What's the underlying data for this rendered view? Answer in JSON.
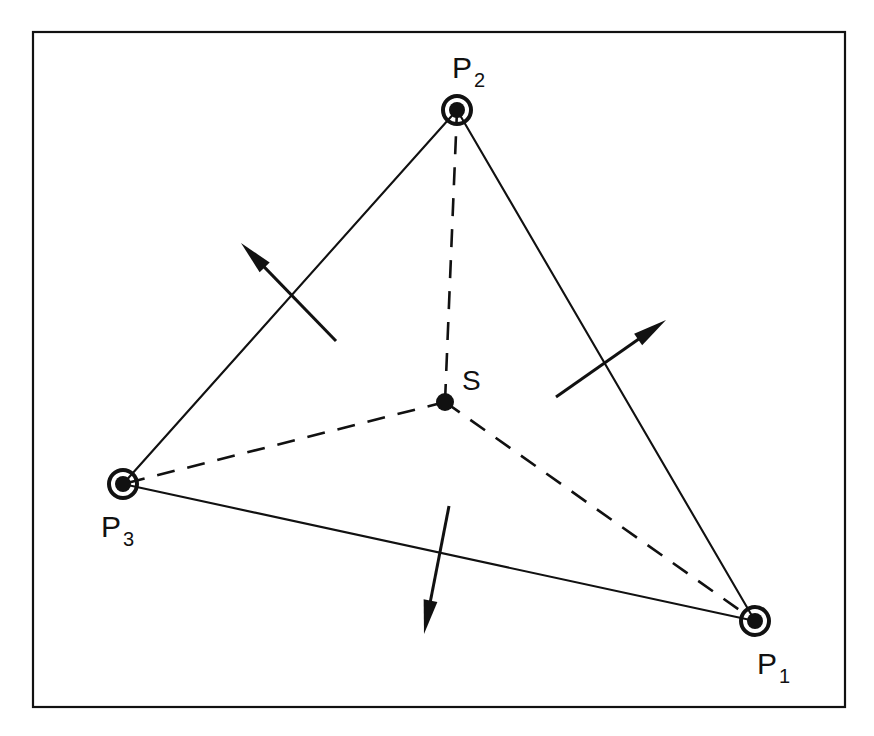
{
  "figure": {
    "background_color": "#ffffff",
    "ink_color": "#111111",
    "frame": {
      "name": "figure-border",
      "x": 33,
      "y": 32,
      "width": 812,
      "height": 675,
      "stroke_width": 2.2
    },
    "nodes": [
      {
        "id": "P1",
        "label": "P",
        "subscript": "1",
        "cx": 755,
        "cy": 621,
        "outer_radius": 16,
        "ring_width": 4,
        "inner_radius": 8,
        "label_x": 757,
        "label_y": 674,
        "sub_x": 779,
        "sub_y": 683
      },
      {
        "id": "P2",
        "label": "P",
        "subscript": "2",
        "cx": 457,
        "cy": 110,
        "outer_radius": 16,
        "ring_width": 4,
        "inner_radius": 8,
        "label_x": 452,
        "label_y": 78,
        "sub_x": 474,
        "sub_y": 87
      },
      {
        "id": "P3",
        "label": "P",
        "subscript": "3",
        "cx": 123,
        "cy": 484,
        "outer_radius": 16,
        "ring_width": 4,
        "inner_radius": 8,
        "label_x": 101,
        "label_y": 537,
        "sub_x": 123,
        "sub_y": 546
      }
    ],
    "centroid": {
      "id": "S",
      "label": "S",
      "cx": 445,
      "cy": 402,
      "radius": 9,
      "label_x": 462,
      "label_y": 390
    },
    "solid_edges": [
      {
        "name": "edge-p2-p3",
        "x1": 457,
        "y1": 110,
        "x2": 123,
        "y2": 484
      },
      {
        "name": "edge-p2-p1",
        "x1": 457,
        "y1": 110,
        "x2": 755,
        "y2": 621
      },
      {
        "name": "edge-p3-p1",
        "x1": 123,
        "y1": 484,
        "x2": 755,
        "y2": 621
      }
    ],
    "dashed_edges": [
      {
        "name": "median-s-p2",
        "x1": 445,
        "y1": 402,
        "x2": 457,
        "y2": 110
      },
      {
        "name": "median-s-p3",
        "x1": 445,
        "y1": 402,
        "x2": 123,
        "y2": 484
      },
      {
        "name": "median-s-p1",
        "x1": 445,
        "y1": 402,
        "x2": 755,
        "y2": 621
      }
    ],
    "dash_pattern": "18 13",
    "arrows": [
      {
        "name": "force-arrow-upper-left",
        "tail_x": 336,
        "tail_y": 341,
        "tip_x": 241,
        "tip_y": 243,
        "head_length": 34,
        "head_half_width": 7
      },
      {
        "name": "force-arrow-right",
        "tail_x": 556,
        "tail_y": 397,
        "tip_x": 666,
        "tip_y": 320,
        "head_length": 34,
        "head_half_width": 7
      },
      {
        "name": "force-arrow-bottom",
        "tail_x": 449,
        "tail_y": 506,
        "tip_x": 424,
        "tip_y": 634,
        "head_length": 34,
        "head_half_width": 7
      }
    ]
  }
}
